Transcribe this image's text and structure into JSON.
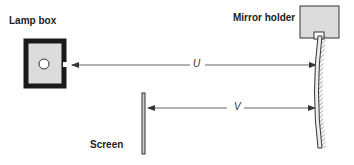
{
  "diagram": {
    "labels": {
      "lamp_box": "Lamp box",
      "mirror_holder": "Mirror holder",
      "screen": "Screen",
      "u": "U",
      "v": "V"
    },
    "colors": {
      "ink": "#222222",
      "fill": "#dcdcdc",
      "line": "#555555"
    }
  }
}
